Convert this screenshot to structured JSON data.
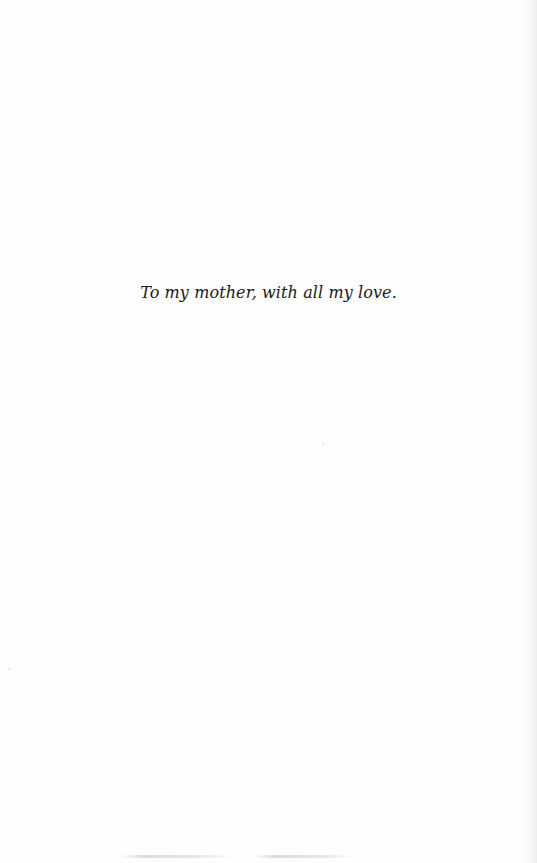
{
  "page": {
    "type": "dedication-page",
    "dedication_text": "To my mother, with all my love."
  },
  "colors": {
    "background": "#fefefe",
    "text": "#1a1a1a",
    "edge_shadow": "#ebebeb"
  }
}
